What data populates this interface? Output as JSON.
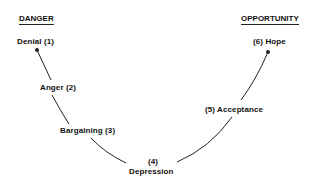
{
  "diagram": {
    "type": "curve",
    "headers": {
      "left": "DANGER",
      "right": "OPPORTUNITY"
    },
    "stages": [
      {
        "number": 1,
        "name": "Denial",
        "label": "Denial (1)"
      },
      {
        "number": 2,
        "name": "Anger",
        "label": "Anger (2)"
      },
      {
        "number": 3,
        "name": "Bargaining",
        "label": "Bargaining (3)"
      },
      {
        "number": 4,
        "name": "Depression",
        "label_number": "(4)",
        "label_name": "Depression"
      },
      {
        "number": 5,
        "name": "Acceptance",
        "label": "(5) Acceptance"
      },
      {
        "number": 6,
        "name": "Hope",
        "label": "(6) Hope"
      }
    ],
    "colors": {
      "line": "#222222",
      "text": "#111111",
      "background": "#ffffff"
    }
  }
}
